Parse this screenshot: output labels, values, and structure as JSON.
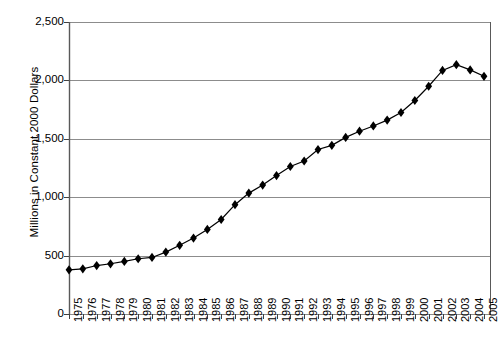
{
  "chart_data": {
    "type": "line",
    "title": "",
    "xlabel": "",
    "ylabel": "Millions in Constant 2000 Dollars",
    "xlim": [
      1975,
      2005
    ],
    "ylim": [
      0,
      2500
    ],
    "ytick_labels": [
      "2,500",
      "2,000",
      "1,500",
      "1,000",
      "500",
      "0"
    ],
    "ytick_values": [
      2500,
      2000,
      1500,
      1000,
      500,
      0
    ],
    "grid": "horizontal",
    "legend": "none",
    "marker": "diamond",
    "line_color": "#000000",
    "marker_color": "#000000",
    "grid_color": "#808080",
    "categories": [
      "1975",
      "1976",
      "1977",
      "1978",
      "1979",
      "1980",
      "1981",
      "1982",
      "1983",
      "1984",
      "1985",
      "1986",
      "1987",
      "1988",
      "1989",
      "1990",
      "1991",
      "1992",
      "1993",
      "1994",
      "1995",
      "1996",
      "1997",
      "1998",
      "1999",
      "2000",
      "2001",
      "2002",
      "2003",
      "2004",
      "2005"
    ],
    "x": [
      1975,
      1976,
      1977,
      1978,
      1979,
      1980,
      1981,
      1982,
      1983,
      1984,
      1985,
      1986,
      1987,
      1988,
      1989,
      1990,
      1991,
      1992,
      1993,
      1994,
      1995,
      1996,
      1997,
      1998,
      1999,
      2000,
      2001,
      2002,
      2003,
      2004,
      2005
    ],
    "values": [
      378,
      387,
      415,
      430,
      450,
      473,
      484,
      530,
      588,
      650,
      724,
      809,
      936,
      1035,
      1104,
      1185,
      1263,
      1310,
      1408,
      1444,
      1512,
      1565,
      1610,
      1660,
      1725,
      1828,
      1950,
      2085,
      2135,
      2090,
      2035
    ],
    "values_note_corrected": [
      378,
      387,
      415,
      430,
      450,
      473,
      484,
      530,
      588,
      650,
      724,
      809,
      936,
      1035,
      1104,
      1185,
      1263,
      1310,
      1408,
      1444,
      1512,
      1565,
      1610,
      1660,
      1725,
      1828,
      1950,
      2085,
      2135,
      2090,
      2035
    ]
  },
  "axes": {
    "plot_left_px": 69,
    "plot_right_px": 490,
    "plot_top_px": 22,
    "plot_bottom_px": 314
  }
}
